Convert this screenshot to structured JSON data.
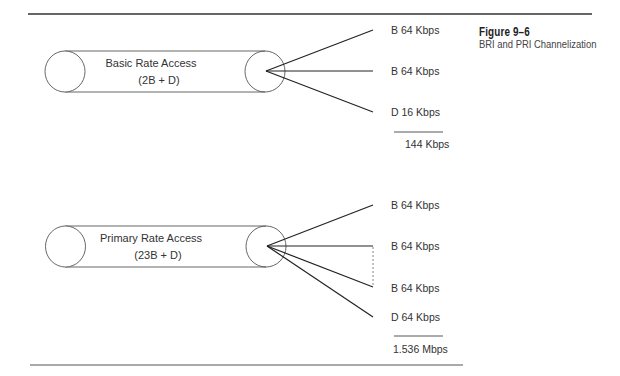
{
  "figure": {
    "number": "Figure 9–6",
    "title": "BRI and PRI Channelization"
  },
  "bri": {
    "name": "Basic Rate Access",
    "composition": "(2B + D)",
    "channels": [
      {
        "label": "B 64 Kbps"
      },
      {
        "label": "B 64 Kbps"
      },
      {
        "label": "D 16 Kbps"
      }
    ],
    "total": "144 Kbps"
  },
  "pri": {
    "name": "Primary Rate Access",
    "composition": "(23B + D)",
    "channels": [
      {
        "label": "B 64 Kbps"
      },
      {
        "label": "B 64 Kbps"
      },
      {
        "label": "B 64 Kbps"
      },
      {
        "label": "D 64 Kbps"
      }
    ],
    "total": "1.536 Mbps"
  },
  "colors": {
    "line": "#222222",
    "outline": "#555555",
    "rule": "#333333"
  }
}
